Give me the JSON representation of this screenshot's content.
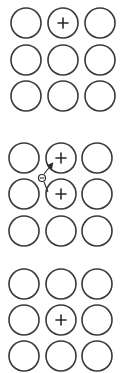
{
  "diagram": {
    "colors": {
      "stroke": "#3a3a3a",
      "background": "#ffffff"
    },
    "atom_radius": 15,
    "panels": [
      {
        "name": "panel-1",
        "rows_y": [
          23,
          60,
          96
        ],
        "cols_x": [
          26,
          63,
          100
        ],
        "charges": [
          {
            "row": 0,
            "col": 1,
            "symbol": "+"
          }
        ],
        "electron": null
      },
      {
        "name": "panel-2",
        "rows_y": [
          158,
          194,
          231
        ],
        "cols_x": [
          24,
          61,
          97
        ],
        "charges": [
          {
            "row": 0,
            "col": 1,
            "symbol": "+"
          },
          {
            "row": 1,
            "col": 1,
            "symbol": "+"
          }
        ],
        "electron": {
          "symbol": "−",
          "x": 42,
          "y": 178,
          "arrow_from": [
            45,
            190
          ],
          "arrow_to": [
            52,
            164
          ]
        }
      },
      {
        "name": "panel-3",
        "rows_y": [
          284,
          320,
          356
        ],
        "cols_x": [
          24,
          61,
          97
        ],
        "charges": [
          {
            "row": 1,
            "col": 1,
            "symbol": "+"
          }
        ],
        "electron": null
      }
    ]
  }
}
